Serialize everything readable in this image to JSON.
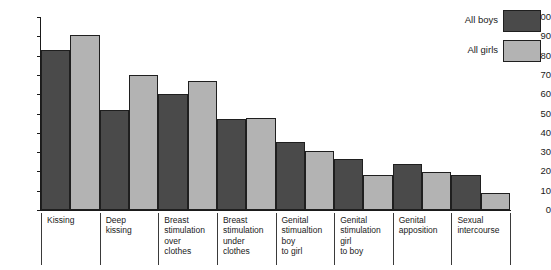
{
  "chart_data": {
    "type": "bar",
    "title": "",
    "xlabel": "",
    "ylabel": "",
    "ylim": [
      0,
      100
    ],
    "yticks": [
      0,
      10,
      20,
      30,
      40,
      50,
      60,
      70,
      80,
      90,
      100
    ],
    "grid": false,
    "legend_position": "top-right",
    "categories": [
      "Kissing",
      "Deep\nkissing",
      "Breast\nstimulation\nover\nclothes",
      "Breast\nstimulation\nunder\nclothes",
      "Genital\nstimualtion\nboy\nto girl",
      "Genital\nstimulation\ngirl\nto boy",
      "Genital\napposition",
      "Sexual\nintercourse"
    ],
    "series": [
      {
        "name": "All boys",
        "color": "#4a4a4a",
        "values": [
          83,
          52,
          60,
          47,
          35,
          26.5,
          24,
          18
        ]
      },
      {
        "name": "All girls",
        "color": "#b3b3b3",
        "values": [
          90.5,
          70,
          67,
          47.5,
          30.5,
          18,
          19.5,
          9
        ]
      }
    ]
  },
  "legend": {
    "items": [
      {
        "label": "All boys"
      },
      {
        "label": "All girls"
      }
    ]
  },
  "colors": {
    "boys": "#4a4a4a",
    "girls": "#b3b3b3",
    "axis": "#1a1a1a",
    "background": "#ffffff"
  }
}
